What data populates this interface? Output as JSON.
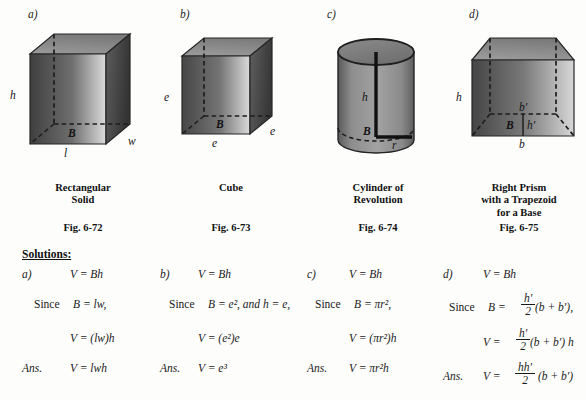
{
  "panels": [
    {
      "letter": "a)",
      "caption": "Rectangular\nSolid",
      "figno": "Fig. 6-72",
      "shape": "rectangular-solid",
      "labels": [
        "h",
        "B",
        "l",
        "w"
      ]
    },
    {
      "letter": "b)",
      "caption": "Cube",
      "figno": "Fig. 6-73",
      "shape": "cube",
      "labels": [
        "e",
        "B",
        "e",
        "e"
      ]
    },
    {
      "letter": "c)",
      "caption": "Cylinder of\nRevolution",
      "figno": "Fig. 6-74",
      "shape": "cylinder-of-revolution",
      "labels": [
        "h",
        "B",
        "r"
      ]
    },
    {
      "letter": "d)",
      "caption": "Right Prism\nwith a Trapezoid\nfor a Base",
      "figno": "Fig. 6-75",
      "shape": "right-prism-trapezoid-base",
      "labels": [
        "h",
        "b'",
        "B",
        "h'",
        "b"
      ]
    }
  ],
  "figure_labels": {
    "a": {
      "h": "h",
      "B": "B",
      "l": "l",
      "w": "w"
    },
    "b": {
      "e_left": "e",
      "B": "B",
      "e_bottom": "e",
      "e_right": "e"
    },
    "c": {
      "h": "h",
      "B": "B",
      "r": "r"
    },
    "d": {
      "h": "h",
      "b_prime": "b′",
      "B": "B",
      "h_prime": "h′",
      "b": "b"
    }
  },
  "solutions": {
    "header": "Solutions:",
    "columns": [
      {
        "tag": "a)",
        "line1": "V  =  Bh",
        "line2_prefix": "Since",
        "line2": "B  =  lw,",
        "line3": "V  =  (lw)h",
        "ans_tag": "Ans.",
        "ans": "V  =  lwh"
      },
      {
        "tag": "b)",
        "line1": "V  =  Bh",
        "line2_prefix": "Since",
        "line2": "B  =  e², and h = e,",
        "line3": "V  =  (e²)e",
        "ans_tag": "Ans.",
        "ans": "V  =  e³"
      },
      {
        "tag": "c)",
        "line1": "V  =  Bh",
        "line2_prefix": "Since",
        "line2": "B  =  πr²,",
        "line3": "V  =  (πr²)h",
        "ans_tag": "Ans.",
        "ans": "V  =  πr²h"
      },
      {
        "tag": "d)",
        "line1": "V  =  Bh",
        "line2_prefix": "Since",
        "line2_lead": "B  =",
        "line2_frac_num": "h′",
        "line2_frac_den": "2",
        "line2_tail": "(b + b′),",
        "line3_lead": "V  =",
        "line3_frac_num": "h′",
        "line3_frac_den": "2",
        "line3_tail": "(b + b′) h",
        "ans_tag": "Ans.",
        "ans_lead": "V  =",
        "ans_frac_num": "hh′",
        "ans_frac_den": "2",
        "ans_tail": "(b + b′)"
      }
    ]
  },
  "colors": {
    "page_background": "#fdfdfc",
    "ink": "#1a1a1a",
    "outline": "#2a2a2a",
    "face_dark": "#4a4a4a",
    "face_mid": "#7c7c7c",
    "face_light": "#d2d2d2",
    "top_face": "#8d8d8d"
  }
}
